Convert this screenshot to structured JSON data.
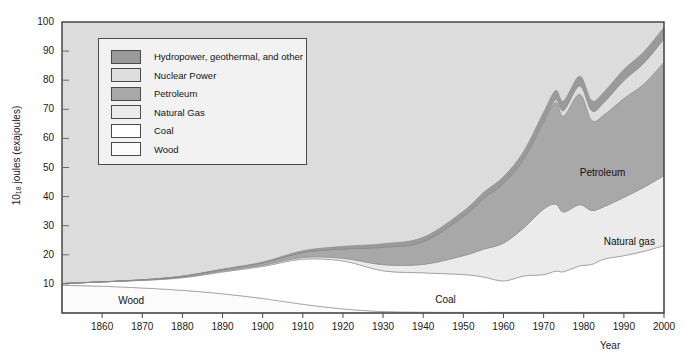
{
  "chart_data": {
    "type": "area",
    "title": "",
    "xlabel": "Year",
    "ylabel": "10_18 joules (exajoules)",
    "ylabel_base": "10",
    "ylabel_sub": "18",
    "ylabel_rest": " joules (exajoules)",
    "xlim": [
      1850,
      2000
    ],
    "ylim": [
      0,
      100
    ],
    "grid": false,
    "legend_position": "upper-left",
    "xticks": [
      1860,
      1870,
      1880,
      1890,
      1900,
      1910,
      1920,
      1930,
      1940,
      1950,
      1960,
      1970,
      1980,
      1990,
      2000
    ],
    "yticks": [
      10,
      20,
      30,
      40,
      50,
      60,
      70,
      80,
      90,
      100
    ],
    "stack_order_bottom_to_top": [
      "Wood",
      "Coal",
      "Natural Gas",
      "Petroleum",
      "Nuclear Power",
      "Hydropower, geothermal, and other"
    ],
    "x": [
      1850,
      1860,
      1870,
      1880,
      1890,
      1900,
      1910,
      1920,
      1930,
      1940,
      1950,
      1955,
      1960,
      1965,
      1970,
      1973,
      1975,
      1979,
      1982,
      1985,
      1990,
      1995,
      2000
    ],
    "series": [
      {
        "name": "Wood",
        "color": "#fbfbfb",
        "values": [
          9.5,
          9.2,
          8.6,
          7.8,
          6.6,
          5.0,
          3.0,
          1.4,
          0.5,
          0.3,
          0.2,
          0.2,
          0.2,
          0.2,
          0.2,
          0.2,
          0.2,
          0.2,
          0.2,
          0.2,
          0.2,
          0.2,
          0.2
        ]
      },
      {
        "name": "Coal",
        "color": "#ffffff",
        "values": [
          0.6,
          1.5,
          2.6,
          4.3,
          7.5,
          11.0,
          15.5,
          16.5,
          14.0,
          13.5,
          13.0,
          12.2,
          10.8,
          12.5,
          13.0,
          14.2,
          14.0,
          16.0,
          16.5,
          18.3,
          19.5,
          21.0,
          23.0
        ]
      },
      {
        "name": "Natural Gas",
        "color": "#ebebeb",
        "values": [
          0.0,
          0.0,
          0.1,
          0.2,
          0.3,
          0.4,
          0.6,
          0.9,
          2.1,
          2.9,
          6.5,
          9.5,
          13.0,
          16.5,
          22.5,
          23.0,
          20.5,
          21.0,
          18.5,
          18.0,
          20.0,
          22.0,
          24.0
        ]
      },
      {
        "name": "Petroleum",
        "color": "#a8a8a8",
        "values": [
          0.0,
          0.0,
          0.1,
          0.3,
          0.5,
          0.8,
          1.7,
          3.2,
          6.0,
          7.8,
          13.5,
          17.5,
          20.5,
          23.5,
          30.0,
          35.0,
          33.0,
          38.0,
          31.0,
          31.5,
          34.0,
          35.5,
          39.0
        ]
      },
      {
        "name": "Nuclear Power",
        "color": "#dedede",
        "values": [
          0.0,
          0.0,
          0.0,
          0.0,
          0.0,
          0.0,
          0.0,
          0.0,
          0.0,
          0.0,
          0.0,
          0.0,
          0.1,
          0.2,
          0.3,
          0.9,
          1.9,
          2.8,
          3.3,
          4.3,
          6.2,
          7.2,
          8.0
        ]
      },
      {
        "name": "Hydropower, geothermal, and other",
        "color": "#9a9a9a",
        "values": [
          0.0,
          0.0,
          0.0,
          0.1,
          0.2,
          0.3,
          0.6,
          0.9,
          1.2,
          1.5,
          1.8,
          2.0,
          2.2,
          2.6,
          3.0,
          3.2,
          3.3,
          3.4,
          3.5,
          3.6,
          3.8,
          3.9,
          4.0
        ]
      }
    ],
    "legend": [
      {
        "label": "Hydropower, geothermal, and other",
        "color": "#9a9a9a"
      },
      {
        "label": "Nuclear Power",
        "color": "#dedede"
      },
      {
        "label": "Petroleum",
        "color": "#a8a8a8"
      },
      {
        "label": "Natural Gas",
        "color": "#ebebeb"
      },
      {
        "label": "Coal",
        "color": "#ffffff"
      },
      {
        "label": "Wood",
        "color": "#fbfbfb"
      }
    ],
    "annotations": [
      {
        "text": "Wood",
        "x": 1864,
        "y": 4.2
      },
      {
        "text": "Coal",
        "x": 1943,
        "y": 4.5
      },
      {
        "text": "Petroleum",
        "x": 1979,
        "y": 48.0
      },
      {
        "text": "Natural gas",
        "x": 1985,
        "y": 24.5
      }
    ],
    "plot_background": "#dcdcdc",
    "frame_color": "#3c3c3c"
  }
}
